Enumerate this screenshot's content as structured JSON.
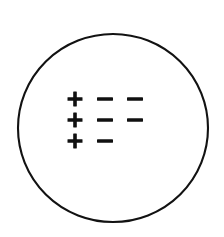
{
  "figure": {
    "title": "Circle containing plus and minus symbols",
    "background_color": "#ffffff",
    "ink_color": "#121212"
  },
  "circle": {
    "label": "circle-outline",
    "center_x": 113,
    "center_y": 128,
    "radius_x": 95,
    "radius_y": 94,
    "stroke_color": "#121212",
    "stroke_width": 2.1,
    "fill_color": "#ffffff"
  },
  "symbol_grid": {
    "label": "charge-symbol-grid",
    "origin_x": 75,
    "origin_y": 99,
    "column_spacing": 30,
    "row_spacing": 21,
    "rows": [
      {
        "index": 1,
        "cells": [
          {
            "symbol": "+",
            "name": "plus",
            "column": 1
          },
          {
            "symbol": "−",
            "name": "minus",
            "column": 2
          },
          {
            "symbol": "−",
            "name": "minus",
            "column": 3
          }
        ]
      },
      {
        "index": 2,
        "cells": [
          {
            "symbol": "+",
            "name": "plus",
            "column": 1
          },
          {
            "symbol": "−",
            "name": "minus",
            "column": 2
          },
          {
            "symbol": "−",
            "name": "minus",
            "column": 3
          }
        ]
      },
      {
        "index": 3,
        "cells": [
          {
            "symbol": "+",
            "name": "plus",
            "column": 1
          },
          {
            "symbol": "−",
            "name": "minus",
            "column": 2
          }
        ]
      }
    ],
    "plus_count": 3,
    "minus_count": 5,
    "glyph": {
      "plus_arm_length": 15,
      "plus_bar_thickness": 3.6,
      "minus_length": 16,
      "minus_thickness": 3.4
    }
  }
}
